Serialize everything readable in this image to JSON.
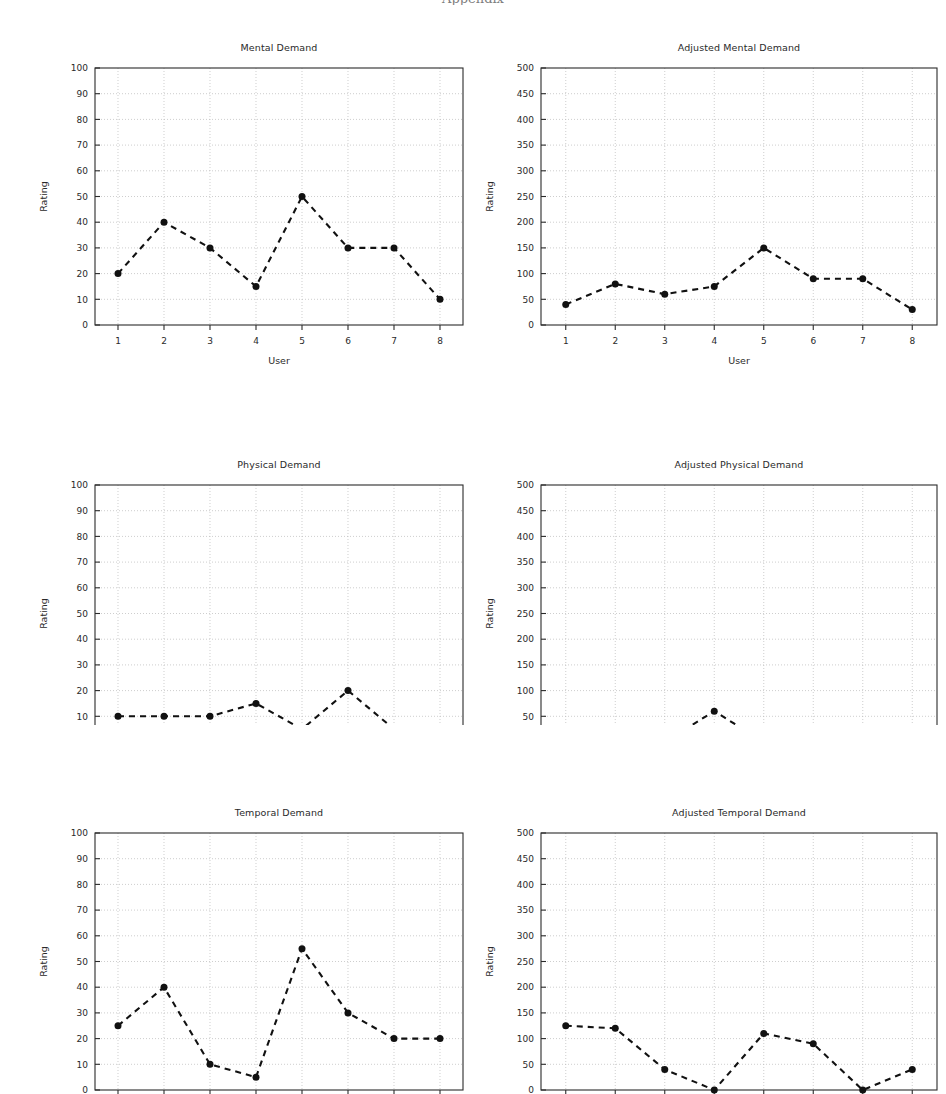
{
  "figure": {
    "cropped_header_text": "Appendix",
    "x_tick_labels": [
      "1",
      "2",
      "3",
      "4",
      "5",
      "6",
      "7",
      "8"
    ],
    "colors": {
      "line": "#111111",
      "marker": "#111111",
      "grid": "#b9b9b9",
      "axis": "#2b2b2b",
      "background": "#ffffff",
      "text": "#2a2a2a"
    }
  },
  "chart_data": [
    {
      "type": "line",
      "id": "mental-demand",
      "title": "Mental Demand",
      "xlabel": "User",
      "ylabel": "Rating",
      "categories": [
        "1",
        "2",
        "3",
        "4",
        "5",
        "6",
        "7",
        "8"
      ],
      "x": [
        1,
        2,
        3,
        4,
        5,
        6,
        7,
        8
      ],
      "values": [
        20,
        40,
        30,
        15,
        50,
        30,
        30,
        10
      ],
      "ylim": [
        0,
        100
      ],
      "xlim": [
        0.5,
        8.5
      ],
      "ytick_labels": [
        "0",
        "10",
        "20",
        "30",
        "40",
        "50",
        "60",
        "70",
        "80",
        "90",
        "100"
      ],
      "yticks": [
        0,
        10,
        20,
        30,
        40,
        50,
        60,
        70,
        80,
        90,
        100
      ],
      "grid": true,
      "legend": "none"
    },
    {
      "type": "line",
      "id": "adjusted-mental-demand",
      "title": "Adjusted Mental Demand",
      "xlabel": "User",
      "ylabel": "Rating",
      "categories": [
        "1",
        "2",
        "3",
        "4",
        "5",
        "6",
        "7",
        "8"
      ],
      "x": [
        1,
        2,
        3,
        4,
        5,
        6,
        7,
        8
      ],
      "values": [
        40,
        80,
        60,
        75,
        150,
        90,
        90,
        30
      ],
      "ylim": [
        0,
        500
      ],
      "xlim": [
        0.5,
        8.5
      ],
      "ytick_labels": [
        "0",
        "50",
        "100",
        "150",
        "200",
        "250",
        "300",
        "350",
        "400",
        "450",
        "500"
      ],
      "yticks": [
        0,
        50,
        100,
        150,
        200,
        250,
        300,
        350,
        400,
        450,
        500
      ],
      "grid": true,
      "legend": "none"
    },
    {
      "type": "line",
      "id": "physical-demand",
      "title": "Physical Demand",
      "xlabel": "User",
      "ylabel": "Rating",
      "categories": [
        "1",
        "2",
        "3",
        "4",
        "5",
        "6",
        "7",
        "8"
      ],
      "x": [
        1,
        2,
        3,
        4,
        5,
        6,
        7,
        8
      ],
      "values": [
        10,
        10,
        10,
        15,
        5,
        20,
        5,
        0
      ],
      "ylim": [
        0,
        100
      ],
      "xlim": [
        0.5,
        8.5
      ],
      "ytick_labels": [
        "0",
        "10",
        "20",
        "30",
        "40",
        "50",
        "60",
        "70",
        "80",
        "90",
        "100"
      ],
      "yticks": [
        0,
        10,
        20,
        30,
        40,
        50,
        60,
        70,
        80,
        90,
        100
      ],
      "grid": true,
      "legend": "none"
    },
    {
      "type": "line",
      "id": "adjusted-physical-demand",
      "title": "Adjusted Physical Demand",
      "xlabel": "User",
      "ylabel": "Rating",
      "categories": [
        "1",
        "2",
        "3",
        "4",
        "5",
        "6",
        "7",
        "8"
      ],
      "x": [
        1,
        2,
        3,
        4,
        5,
        6,
        7,
        8
      ],
      "values": [
        0,
        0,
        0,
        60,
        0,
        0,
        5,
        0
      ],
      "ylim": [
        0,
        500
      ],
      "xlim": [
        0.5,
        8.5
      ],
      "ytick_labels": [
        "0",
        "50",
        "100",
        "150",
        "200",
        "250",
        "300",
        "350",
        "400",
        "450",
        "500"
      ],
      "yticks": [
        0,
        50,
        100,
        150,
        200,
        250,
        300,
        350,
        400,
        450,
        500
      ],
      "grid": true,
      "legend": "none"
    },
    {
      "type": "line",
      "id": "temporal-demand",
      "title": "Temporal Demand",
      "xlabel": "User",
      "ylabel": "Rating",
      "categories": [
        "1",
        "2",
        "3",
        "4",
        "5",
        "6",
        "7",
        "8"
      ],
      "x": [
        1,
        2,
        3,
        4,
        5,
        6,
        7,
        8
      ],
      "values": [
        25,
        40,
        10,
        5,
        55,
        30,
        20,
        20
      ],
      "ylim": [
        0,
        100
      ],
      "xlim": [
        0.5,
        8.5
      ],
      "ytick_labels": [
        "0",
        "10",
        "20",
        "30",
        "40",
        "50",
        "60",
        "70",
        "80",
        "90",
        "100"
      ],
      "yticks": [
        0,
        10,
        20,
        30,
        40,
        50,
        60,
        70,
        80,
        90,
        100
      ],
      "grid": true,
      "legend": "none"
    },
    {
      "type": "line",
      "id": "adjusted-temporal-demand",
      "title": "Adjusted Temporal Demand",
      "xlabel": "User",
      "ylabel": "Rating",
      "categories": [
        "1",
        "2",
        "3",
        "4",
        "5",
        "6",
        "7",
        "8"
      ],
      "x": [
        1,
        2,
        3,
        4,
        5,
        6,
        7,
        8
      ],
      "values": [
        125,
        120,
        40,
        0,
        110,
        90,
        0,
        40
      ],
      "ylim": [
        0,
        500
      ],
      "xlim": [
        0.5,
        8.5
      ],
      "ytick_labels": [
        "0",
        "50",
        "100",
        "150",
        "200",
        "250",
        "300",
        "350",
        "400",
        "450",
        "500"
      ],
      "yticks": [
        0,
        50,
        100,
        150,
        200,
        250,
        300,
        350,
        400,
        450,
        500
      ],
      "grid": true,
      "legend": "none"
    }
  ]
}
